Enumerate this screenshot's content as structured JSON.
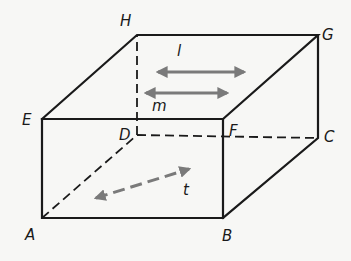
{
  "figure": {
    "type": "cuboid",
    "colors": {
      "edges": "#1a1a1a",
      "vectors": "#7a7a7a",
      "background": "#f7f7f5"
    },
    "vertices": {
      "A": {
        "label": "A",
        "x": 42,
        "y": 218
      },
      "B": {
        "label": "B",
        "x": 223,
        "y": 218
      },
      "C": {
        "label": "C",
        "x": 318,
        "y": 138
      },
      "D": {
        "label": "D",
        "x": 137,
        "y": 135
      },
      "E": {
        "label": "E",
        "x": 42,
        "y": 119
      },
      "F": {
        "label": "F",
        "x": 223,
        "y": 119
      },
      "G": {
        "label": "G",
        "x": 318,
        "y": 35
      },
      "H": {
        "label": "H",
        "x": 137,
        "y": 35
      }
    },
    "visible_edges": [
      "AB",
      "BF",
      "FE",
      "EA",
      "EH",
      "HG",
      "GF",
      "GC",
      "CB"
    ],
    "hidden_edges": [
      "AD",
      "DC",
      "DH"
    ],
    "vectors": [
      {
        "id": "l",
        "label": "l",
        "style": "solid",
        "heads": "both"
      },
      {
        "id": "m",
        "label": "m",
        "style": "solid",
        "heads": "both"
      },
      {
        "id": "t",
        "label": "t",
        "style": "dashed",
        "heads": "both"
      }
    ]
  }
}
